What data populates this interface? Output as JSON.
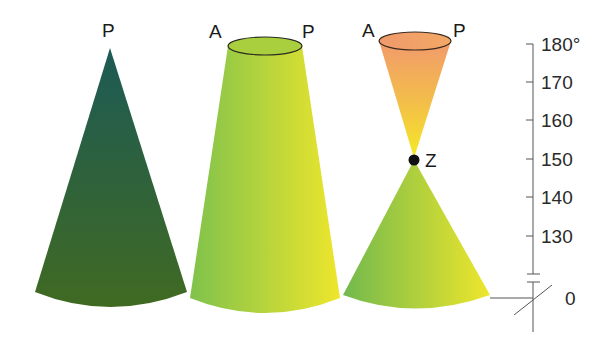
{
  "diagram": {
    "type": "cone-comparison",
    "cones": [
      {
        "id": "cone-1",
        "labels": [
          "P"
        ],
        "fill_top": "#1d5a54",
        "fill_bottom": "#3f6a22"
      },
      {
        "id": "cone-2",
        "labels": [
          "A",
          "P"
        ],
        "fill_left": "#7fc24a",
        "fill_right": "#ece52e"
      },
      {
        "id": "cone-3",
        "labels": [
          "A",
          "P",
          "Z"
        ],
        "top_fill_top": "#f29a6a",
        "top_fill_bottom": "#f5e32a",
        "bottom_fill_left": "#77bb4c",
        "bottom_fill_right": "#ece52e"
      }
    ],
    "point_label": "Z",
    "axis": {
      "ticks": [
        "180°",
        "170",
        "160",
        "150",
        "140",
        "130",
        "0"
      ],
      "break": true
    }
  },
  "labels": {
    "c1_p": "P",
    "c2_a": "A",
    "c2_p": "P",
    "c3_a": "A",
    "c3_p": "P",
    "z": "Z"
  }
}
